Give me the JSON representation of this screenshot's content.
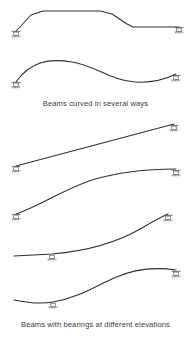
{
  "figure": {
    "title_visible": false,
    "captions": [
      {
        "id": "caption-1",
        "text": "Beams curved in several ways"
      },
      {
        "id": "caption-2",
        "text": "Beams with bearings at different elevations"
      }
    ],
    "stroke_colors": {
      "beam": "#2f2f2f",
      "bearing": "#666666",
      "caption_text": "#3b3b3b",
      "background": "#ffffff"
    },
    "diagrams": [
      {
        "name": "beam-trapezoidal-polyline",
        "description": "Beam rising from left bearing, flat crown, descending then flat to right bearing",
        "path": "M 16 31 L 21 26 L 31 15 L 43 11 L 100 11 L 112 14 L 127 24 L 133 27 L 179 27",
        "bearings": [
          {
            "name": "bearing-left",
            "x": 16,
            "y": 31,
            "type": "elevated"
          },
          {
            "name": "bearing-right",
            "x": 179,
            "y": 27,
            "type": "elevated"
          }
        ]
      },
      {
        "name": "beam-s-curve",
        "description": "Beam with S-shaped double curvature between two bearings",
        "path": "M 16 82 C 30 62 48 58 72 62 C 96 66 110 80 135 82 C 152 83 166 79 176 74",
        "bearings": [
          {
            "name": "bearing-left",
            "x": 16,
            "y": 82,
            "type": "elevated"
          },
          {
            "name": "bearing-right",
            "x": 176,
            "y": 74,
            "type": "elevated"
          }
        ]
      },
      {
        "name": "beam-straight-incline",
        "description": "Straight beam inclined upward from low left bearing to high right bearing",
        "path": "M 16 166 L 174 124",
        "bearings": [
          {
            "name": "bearing-left",
            "x": 16,
            "y": 166,
            "type": "elevated"
          },
          {
            "name": "bearing-right",
            "x": 174,
            "y": 124,
            "type": "elevated"
          }
        ]
      },
      {
        "name": "beam-arched-incline",
        "description": "Curved beam arching upward from low left bearing to high right bearing",
        "path": "M 16 214 C 40 206 62 190 92 180 C 122 171 152 169 176 169",
        "bearings": [
          {
            "name": "bearing-left",
            "x": 16,
            "y": 214,
            "type": "elevated"
          },
          {
            "name": "bearing-right",
            "x": 176,
            "y": 169,
            "type": "elevated"
          }
        ]
      },
      {
        "name": "beam-cantilever-rising",
        "description": "Beam with free left overhang, interior bearing, rising curve to high right bearing",
        "path": "M 14 256 L 52 254 C 88 251 118 242 142 228 C 152 222 161 217 168 214",
        "bearings": [
          {
            "name": "bearing-interior",
            "x": 52,
            "y": 254,
            "type": "interior"
          },
          {
            "name": "bearing-right",
            "x": 168,
            "y": 214,
            "type": "elevated"
          }
        ]
      },
      {
        "name": "beam-cantilever-s-curve",
        "description": "Beam with free left overhang, interior bearing, S-curve rising to right bearing",
        "path": "M 14 300 C 28 303 42 304 53 302 C 78 298 96 286 114 278 C 134 269 156 267 176 270",
        "bearings": [
          {
            "name": "bearing-interior",
            "x": 53,
            "y": 302,
            "type": "interior"
          },
          {
            "name": "bearing-right",
            "x": 176,
            "y": 270,
            "type": "elevated"
          }
        ]
      }
    ]
  }
}
